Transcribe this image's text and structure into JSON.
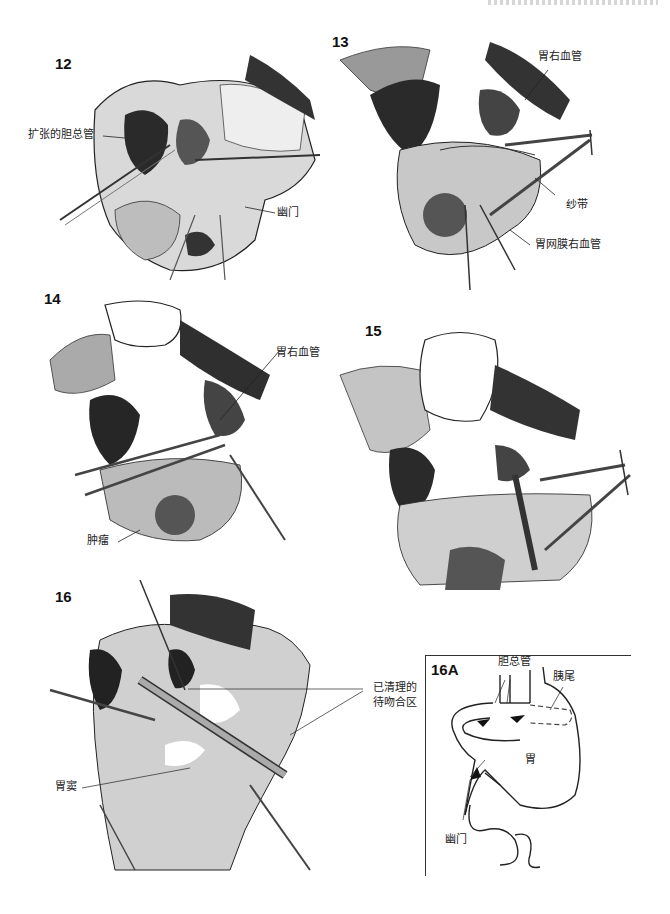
{
  "page": {
    "header_fragment": ""
  },
  "figures": [
    {
      "number": "12",
      "labels": [
        {
          "text": "扩张的胆总管"
        },
        {
          "text": "幽门"
        }
      ]
    },
    {
      "number": "13",
      "labels": [
        {
          "text": "胃右血管"
        },
        {
          "text": "纱带"
        },
        {
          "text": "胃网膜右血管"
        }
      ]
    },
    {
      "number": "14",
      "labels": [
        {
          "text": "胃右血管"
        },
        {
          "text": "肿瘤"
        }
      ]
    },
    {
      "number": "15",
      "labels": []
    },
    {
      "number": "16",
      "labels": [
        {
          "text": "已清理的"
        },
        {
          "text": "待吻合区"
        },
        {
          "text": "胃窦"
        }
      ]
    },
    {
      "number": "16A",
      "labels": [
        {
          "text": "胆总管"
        },
        {
          "text": "胰尾"
        },
        {
          "text": "胃"
        },
        {
          "text": "幽门"
        }
      ]
    }
  ]
}
